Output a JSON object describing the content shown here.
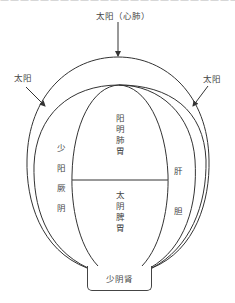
{
  "header": {
    "truncated_text": "——————————————————————————————————"
  },
  "labels": {
    "top": "太阳（心肺）",
    "left": "太阳",
    "right": "太阳"
  },
  "regions": {
    "upper_center": [
      "阳",
      "明",
      "肺",
      "胃"
    ],
    "lower_center": [
      "太",
      "阴",
      "脾",
      "胃"
    ],
    "left_column": [
      "少",
      "阳",
      "厥",
      "阴"
    ],
    "right_column": [
      "肝",
      "胆"
    ],
    "bottom_box": "少阴肾"
  },
  "colors": {
    "line": "#333333",
    "text": "#444444",
    "background": "#ffffff"
  }
}
